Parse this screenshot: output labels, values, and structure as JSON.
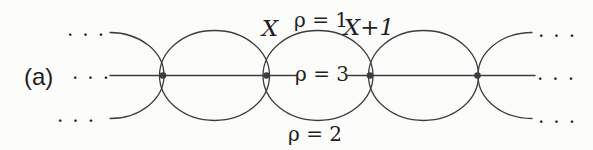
{
  "figure": {
    "panel_label": "(a)",
    "ellipsis": "..."
  },
  "labels": {
    "site_x": "X",
    "site_x_next": "X+1",
    "rho_top": "ρ = 1",
    "rho_middle": "ρ = 3",
    "rho_bottom": "ρ = 2"
  },
  "colors": {
    "background": "#fcfcfb",
    "stroke": "#3c3c3c",
    "text": "#1f1f1f"
  }
}
